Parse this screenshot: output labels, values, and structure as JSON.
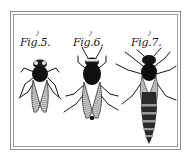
{
  "plate": {
    "background": "#ffffff",
    "frame_color": "#8c8c8c",
    "ink_color": "#141414",
    "figures": [
      {
        "id": "fig5",
        "label": "Fig.5.",
        "subject": "bee-drone"
      },
      {
        "id": "fig6",
        "label": "Fig.6.",
        "subject": "bee-worker"
      },
      {
        "id": "fig7",
        "label": "Fig.7.",
        "subject": "bee-queen"
      }
    ]
  }
}
